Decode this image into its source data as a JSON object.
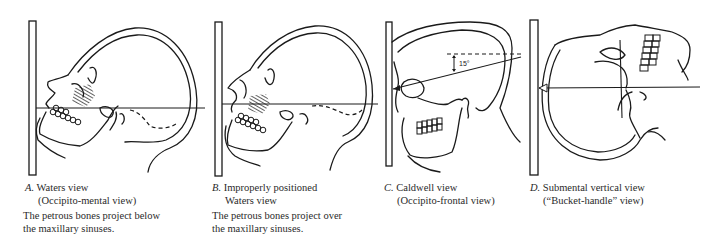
{
  "figure": {
    "panels": [
      {
        "id": "A",
        "letter": "A.",
        "title": "Waters view",
        "subtitle": "(Occipito-mental view)",
        "description_line1": "The petrous bones project below",
        "description_line2": "the maxillary sinuses."
      },
      {
        "id": "B",
        "letter": "B.",
        "title": "Improperly positioned",
        "subtitle": "Waters view",
        "description_line1": "The petrous bones project over",
        "description_line2": "the maxillary sinuses."
      },
      {
        "id": "C",
        "letter": "C.",
        "title": "Caldwell view",
        "subtitle": "(Occipito-frontal view)",
        "angle_label": "15°"
      },
      {
        "id": "D",
        "letter": "D.",
        "title": "Submental vertical view",
        "subtitle": "(“Bucket-handle” view)"
      }
    ],
    "colors": {
      "line": "#1a1a1a",
      "text": "#2a2a2a",
      "background": "#ffffff"
    }
  }
}
